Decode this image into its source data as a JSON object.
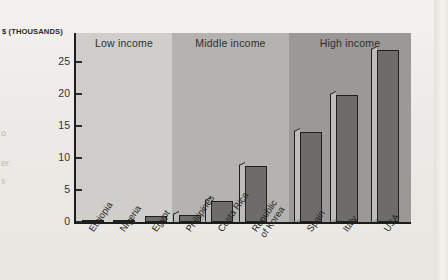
{
  "figure": {
    "axis_unit_label": "$ (THOUSANDS)",
    "bands": [
      {
        "key": "low",
        "label": "Low income",
        "color": "#cfcecb"
      },
      {
        "key": "mid",
        "label": "Middle income",
        "color": "#b4b3b0"
      },
      {
        "key": "high",
        "label": "High income",
        "color": "#9a9996"
      }
    ],
    "y_ticks": [
      "0",
      "5",
      "10",
      "15",
      "20",
      "25"
    ],
    "bar_color": "#6d6c6a",
    "bar_side_color": "#bdbcb9",
    "axis_color": "#1c1c1c"
  },
  "margin_fragments": [
    "o",
    "er",
    "s"
  ],
  "chart_data": {
    "type": "bar",
    "title": "",
    "xlabel": "",
    "ylabel": "$ (THOUSANDS)",
    "ylim": [
      0,
      28
    ],
    "yticks": [
      0,
      5,
      10,
      15,
      20,
      25
    ],
    "grid": false,
    "legend": false,
    "categories": [
      "Ethiopia",
      "Nigeria",
      "Egypt",
      "Phillipines",
      "Costa Rica",
      "Republic\nof Korea",
      "Spain",
      "Italy",
      "USA"
    ],
    "groups": [
      {
        "name": "Low income",
        "categories": [
          "Ethiopia",
          "Nigeria",
          "Egypt"
        ]
      },
      {
        "name": "Middle income",
        "categories": [
          "Phillipines",
          "Costa Rica",
          "Republic of Korea"
        ]
      },
      {
        "name": "High income",
        "categories": [
          "Spain",
          "Italy",
          "USA"
        ]
      }
    ],
    "values": [
      0.1,
      0.3,
      0.9,
      1.1,
      3.3,
      8.7,
      14.0,
      19.9,
      26.8
    ]
  }
}
